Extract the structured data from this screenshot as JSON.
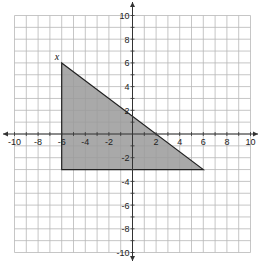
{
  "graph": {
    "x_range": [
      -10,
      10
    ],
    "y_range": [
      -10,
      10
    ],
    "grid_step": 1,
    "x_tick_labels": [
      "-10",
      "-8",
      "-6",
      "-4",
      "-2",
      "2",
      "4",
      "6",
      "8",
      "10"
    ],
    "y_tick_labels": [
      "10",
      "8",
      "6",
      "4",
      "2",
      "-2",
      "-4",
      "-6",
      "-8",
      "-10"
    ],
    "colors": {
      "grid": "#b8b8b8",
      "axis": "#333333",
      "fill": "#9a9a9a",
      "edge": "#222222"
    }
  },
  "triangle": {
    "vertices": [
      [
        -6,
        6
      ],
      [
        -6,
        -3
      ],
      [
        6,
        -3
      ]
    ],
    "vertex_label": "x"
  },
  "chart_data": {
    "type": "scatter",
    "title": "",
    "xlabel": "",
    "ylabel": "",
    "xlim": [
      -10,
      10
    ],
    "ylim": [
      -10,
      10
    ],
    "grid": true,
    "x_ticks": [
      -10,
      -8,
      -6,
      -4,
      -2,
      2,
      4,
      6,
      8,
      10
    ],
    "y_ticks": [
      10,
      8,
      6,
      4,
      2,
      -2,
      -4,
      -6,
      -8,
      -10
    ],
    "series": [
      {
        "name": "shaded triangle",
        "shape": "polygon",
        "points": [
          [
            -6,
            6
          ],
          [
            -6,
            -3
          ],
          [
            6,
            -3
          ]
        ],
        "filled": true
      }
    ],
    "annotations": [
      {
        "text": "x",
        "at": [
          -6,
          6
        ]
      }
    ]
  }
}
